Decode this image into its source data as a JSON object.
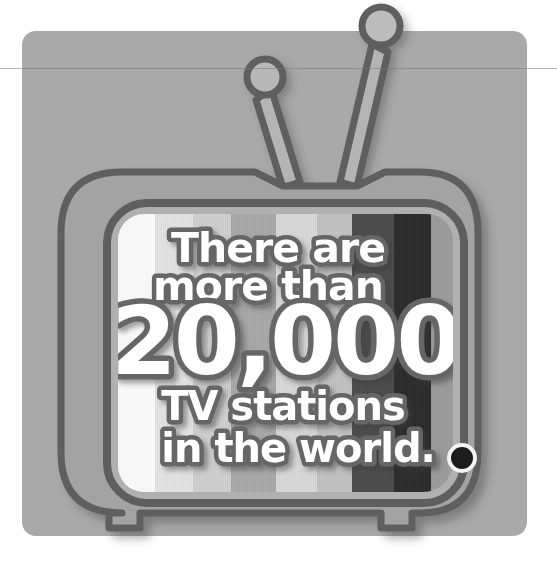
{
  "poster": {
    "headline_line1": "There are",
    "headline_line2": "more than",
    "big_number": "20,000",
    "subline1": "TV stations",
    "subline2": "in the world.",
    "alt_text": "Retro television illustration with colour bars on screen",
    "background_color": "#a9a9a9",
    "card_color": "#a9a9a9",
    "page_color": "#ffffff"
  },
  "tv": {
    "body_fill": "#a3a3a3",
    "body_outline": "#5e5e5e",
    "outline_width": 7,
    "bezel_fill": "#b0b0b0",
    "antenna_fill": "#b4b4b4",
    "antenna_outline": "#5e5e5e",
    "shadow_color": "rgba(60,60,60,0.38)",
    "knob_color": "#1c1c1c",
    "knob_ring_color": "#f2f2f2",
    "feet_count": 2
  },
  "screen": {
    "label": "tv-screen-color-bars",
    "bars": [
      {
        "name": "bar-white",
        "color": "#fbfbfb",
        "left_pct": 0,
        "width_pct": 11.0
      },
      {
        "name": "bar-light-gray",
        "color": "#e3e3e3",
        "left_pct": 11.0,
        "width_pct": 11.4
      },
      {
        "name": "bar-pale-gray",
        "color": "#cfcfcf",
        "left_pct": 22.4,
        "width_pct": 11.4
      },
      {
        "name": "bar-mid-gray",
        "color": "#a8a8a8",
        "left_pct": 33.8,
        "width_pct": 13.5
      },
      {
        "name": "bar-soft-gray",
        "color": "#d8d8d8",
        "left_pct": 47.3,
        "width_pct": 12.0
      },
      {
        "name": "bar-light-warm",
        "color": "#c2c2c2",
        "left_pct": 59.3,
        "width_pct": 10.5
      },
      {
        "name": "bar-dark-gray",
        "color": "#4a4a4a",
        "left_pct": 69.8,
        "width_pct": 12.5
      },
      {
        "name": "bar-near-black",
        "color": "#2a2a2a",
        "left_pct": 82.3,
        "width_pct": 11.2
      },
      {
        "name": "bar-edge-gray",
        "color": "#9b9b9b",
        "left_pct": 93.5,
        "width_pct": 6.5
      }
    ]
  },
  "caption_style": {
    "fill": "#ffffff",
    "stroke": "#666666",
    "shadow": "rgba(55,55,55,0.45)"
  },
  "icons": {
    "antenna_left": "antenna-icon",
    "antenna_right": "antenna-icon",
    "knob": "dial-knob-icon"
  }
}
